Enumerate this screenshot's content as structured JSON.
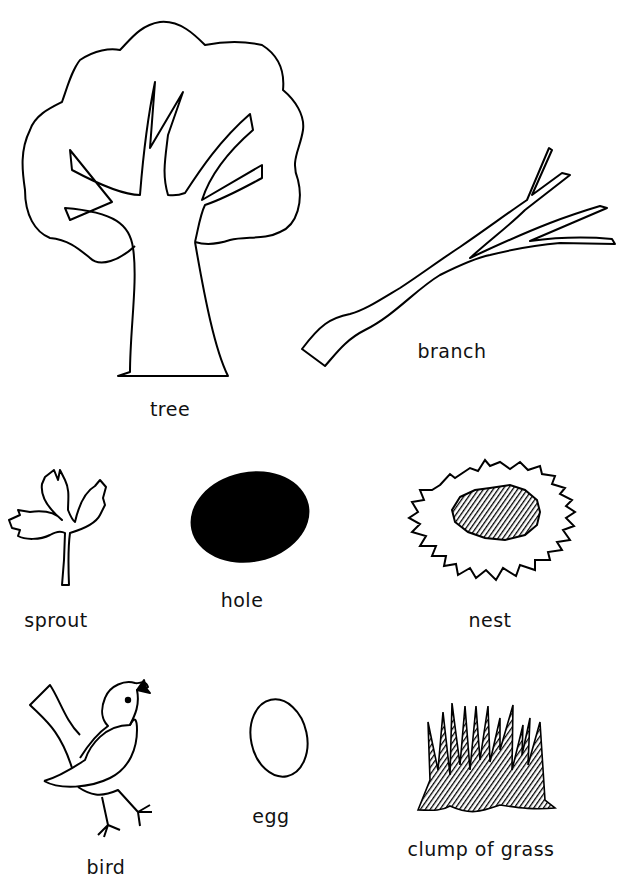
{
  "page": {
    "background": "#ffffff",
    "ink": "#000000"
  },
  "items": {
    "tree": {
      "label": "tree",
      "icon": "tree-icon"
    },
    "branch": {
      "label": "branch",
      "icon": "branch-icon"
    },
    "sprout": {
      "label": "sprout",
      "icon": "sprout-icon"
    },
    "hole": {
      "label": "hole",
      "icon": "hole-icon"
    },
    "nest": {
      "label": "nest",
      "icon": "nest-icon"
    },
    "bird": {
      "label": "bird",
      "icon": "bird-icon"
    },
    "egg": {
      "label": "egg",
      "icon": "egg-icon"
    },
    "grass": {
      "label": "clump of grass",
      "icon": "grass-icon"
    }
  }
}
